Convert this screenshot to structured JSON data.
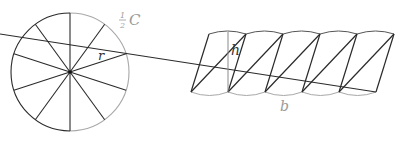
{
  "diagram": {
    "colors": {
      "dark_stroke": "#2a2a2a",
      "light_stroke": "#a8a8a8",
      "label_gray": "#9a9a9a",
      "label_dark": "#333333"
    },
    "circle": {
      "center": [
        70,
        72
      ],
      "radius": 59,
      "sectors": 10,
      "radius_label": "r",
      "half_circumference_label": {
        "fraction_num": "1",
        "fraction_den": "2",
        "symbol": "C"
      }
    },
    "strip": {
      "top_y": 34,
      "bottom_y": 92,
      "top_points_x": [
        209,
        246,
        283,
        320,
        357,
        394
      ],
      "bottom_points_x": [
        191,
        228,
        265,
        302,
        339,
        376
      ],
      "height_label": "h",
      "base_label": "b"
    }
  }
}
